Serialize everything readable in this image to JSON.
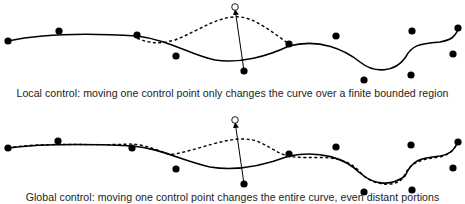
{
  "panels": [
    {
      "id": "local",
      "caption": "Local control: moving one control point only changes the curve over a finite bounded region",
      "control_points": [
        [
          8,
          41
        ],
        [
          59,
          31
        ],
        [
          137,
          35
        ],
        [
          176,
          56
        ],
        [
          244,
          71
        ],
        [
          289,
          44
        ],
        [
          336,
          36
        ],
        [
          364,
          80
        ],
        [
          412,
          31
        ],
        [
          411,
          75
        ],
        [
          458,
          28
        ],
        [
          453,
          54
        ]
      ],
      "moved_from": [
        244,
        71
      ],
      "moved_to": [
        235,
        7
      ],
      "original_curve": "M8,41 C40,34 90,33 137,36 C170,40 190,55 215,60 C240,64 268,56 289,46 C320,38 345,50 360,62 C375,74 395,72 405,58 C412,45 418,44 440,42 C452,40 455,36 458,30",
      "modified_curve": "M137,38 C150,44 160,44 175,40 C200,30 220,15 240,17 C255,18 275,34 289,44"
    },
    {
      "id": "global",
      "caption": "Global control: moving one control point changes the entire curve, even distant portions",
      "control_points": [
        [
          8,
          148
        ],
        [
          58,
          141
        ],
        [
          132,
          148
        ],
        [
          176,
          169
        ],
        [
          244,
          184
        ],
        [
          289,
          154
        ],
        [
          336,
          147
        ],
        [
          364,
          192
        ],
        [
          412,
          190
        ],
        [
          411,
          145
        ],
        [
          458,
          142
        ],
        [
          453,
          168
        ]
      ],
      "moved_from": [
        244,
        184
      ],
      "moved_to": [
        235,
        120
      ],
      "original_curve": "M8,148 C40,144 90,144 132,146 C160,148 180,160 210,167 C240,172 268,164 289,156 C320,150 345,158 360,173 C375,186 392,186 405,176 C412,160 420,158 440,156 C452,154 455,148 458,142",
      "modified_curve": "M8,148 C40,142 90,146 132,144 C155,146 165,156 175,154 C200,149 225,138 245,139 C265,140 275,154 289,156 C310,161 340,150 360,172 C372,186 395,188 403,178 C410,164 415,160 440,157 C452,154 455,148 458,142"
    }
  ],
  "colors": {
    "curve": "#000000",
    "point_fill": "#000000",
    "moved_point_fill": "#ffffff",
    "caption_text": "#222222"
  },
  "icons": {
    "control_point": "filled-circle",
    "moved_point": "hollow-circle",
    "arrow": "arrowhead"
  }
}
